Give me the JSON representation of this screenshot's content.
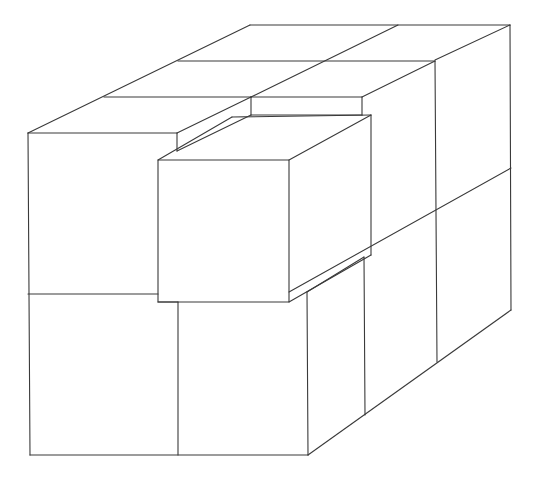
{
  "figure": {
    "type": "isometric-cube-stack",
    "colors": {
      "stroke": "#3a3a3a",
      "background": "#ffffff"
    }
  }
}
